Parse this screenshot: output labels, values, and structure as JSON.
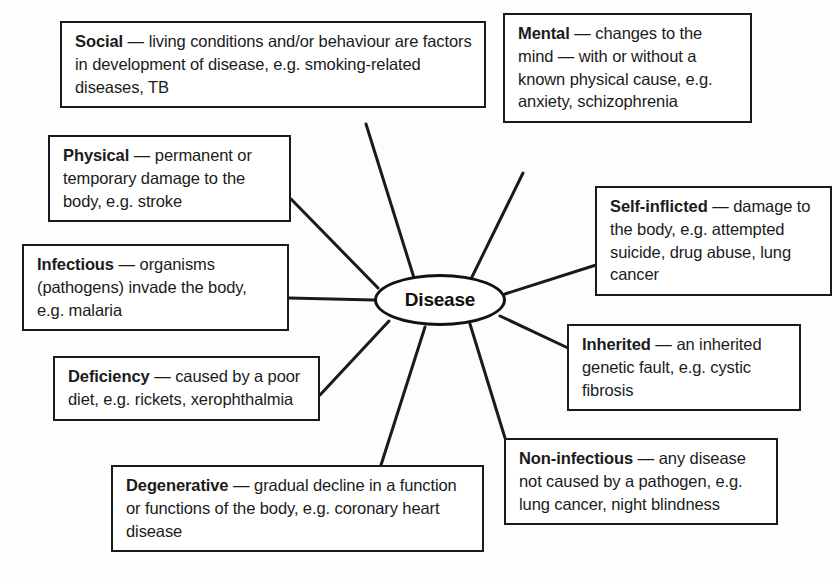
{
  "diagram": {
    "title": "Disease",
    "type": "mind-map",
    "center": {
      "label": "Disease",
      "shape": "ellipse"
    },
    "colors": {
      "background": "#fdfdfd",
      "box_fill": "#ffffff",
      "stroke": "#1a1a1a",
      "text": "#1b1b1b"
    },
    "nodes": [
      {
        "id": "social",
        "term": "Social",
        "dash": " — ",
        "description": "living conditions and/or behaviour are factors in development of disease, e.g. smoking-related diseases, TB"
      },
      {
        "id": "mental",
        "term": "Mental",
        "dash": " — ",
        "description": "changes to the mind — with or without a known physical cause, e.g. anxiety, schizophrenia"
      },
      {
        "id": "physical",
        "term": "Physical",
        "dash": " — ",
        "description": "permanent or temporary damage to the body, e.g. stroke"
      },
      {
        "id": "infectious",
        "term": "Infectious",
        "dash": " — ",
        "description": "organisms (pathogens) invade the body, e.g. malaria"
      },
      {
        "id": "deficiency",
        "term": "Deficiency",
        "dash": " — ",
        "description": "caused by a poor diet, e.g. rickets, xerophthalmia"
      },
      {
        "id": "degenerative",
        "term": "Degenerative",
        "dash": " — ",
        "description": "gradual decline in a function or functions of the body, e.g. coronary heart disease"
      },
      {
        "id": "self-inflicted",
        "term": "Self-inflicted",
        "dash": " — ",
        "description": "damage to the body, e.g. attempted suicide, drug abuse, lung cancer"
      },
      {
        "id": "inherited",
        "term": "Inherited",
        "dash": " — ",
        "description": "an inherited genetic fault, e.g. cystic fibrosis"
      },
      {
        "id": "non-infectious",
        "term": "Non-infectious",
        "dash": " — ",
        "description": "any disease not caused by a pathogen, e.g. lung cancer, night blindness"
      }
    ]
  }
}
